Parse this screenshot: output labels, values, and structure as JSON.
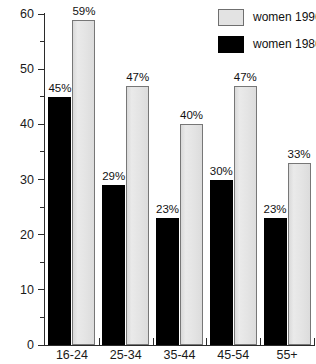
{
  "chart_data": {
    "type": "bar",
    "title": "",
    "xlabel": "",
    "ylabel": "",
    "ylim": [
      0,
      60
    ],
    "ytick_step": 10,
    "yticks": [
      "0",
      "10",
      "20",
      "30",
      "40",
      "50",
      "60"
    ],
    "grid": false,
    "legend_position": "top-right",
    "categories": [
      "16-24",
      "25-34",
      "35-44",
      "45-54",
      "55+"
    ],
    "series": [
      {
        "name": "women 1986",
        "color": "#000000",
        "values": [
          45,
          29,
          23,
          30,
          23
        ],
        "data_labels": [
          "45%",
          "29%",
          "23%",
          "30%",
          "23%"
        ]
      },
      {
        "name": "women 1996",
        "color": "#e3e3e3",
        "values": [
          59,
          47,
          40,
          47,
          33
        ],
        "data_labels": [
          "59%",
          "47%",
          "40%",
          "47%",
          "33%"
        ]
      }
    ]
  },
  "legend": {
    "entries": [
      {
        "label": "women 1996",
        "swatch": "s1996"
      },
      {
        "label": "women 1986",
        "swatch": "s1986"
      }
    ]
  }
}
